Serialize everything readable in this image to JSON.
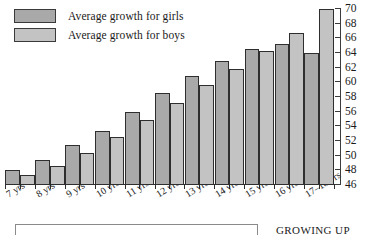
{
  "legend": {
    "items": [
      {
        "label": "Average growth for girls",
        "color": "#a9a9a9",
        "swatch_name": "legend-swatch-girls"
      },
      {
        "label": "Average growth for boys",
        "color": "#c3c3c3",
        "swatch_name": "legend-swatch-boys"
      }
    ]
  },
  "caption": {
    "text": "GROWING UP"
  },
  "chart_data": {
    "type": "bar",
    "title": "",
    "xlabel": "",
    "ylabel": "",
    "ylim": [
      46,
      70
    ],
    "ytick_step": 2,
    "yticks": [
      46,
      48,
      50,
      52,
      54,
      56,
      58,
      60,
      62,
      64,
      66,
      68,
      70
    ],
    "grid": false,
    "legend_position": "top-left",
    "axis_position": "right",
    "categories": [
      "7 yrs",
      "8 yrs",
      "9 yrs",
      "10 yrs",
      "11 yrs",
      "12 yrs",
      "13 yrs",
      "14 yrs",
      "15 yrs",
      "16 yrs",
      "17–18 yrs"
    ],
    "series": [
      {
        "name": "Average growth for girls",
        "color": "#a9a9a9",
        "values": [
          48.0,
          49.4,
          51.5,
          53.4,
          55.9,
          58.6,
          60.9,
          62.9,
          64.6,
          65.2,
          64.0
        ]
      },
      {
        "name": "Average growth for boys",
        "color": "#c3c3c3",
        "values": [
          47.4,
          48.6,
          50.4,
          52.6,
          54.8,
          57.2,
          59.6,
          61.8,
          64.3,
          66.7,
          70.0
        ]
      }
    ]
  }
}
